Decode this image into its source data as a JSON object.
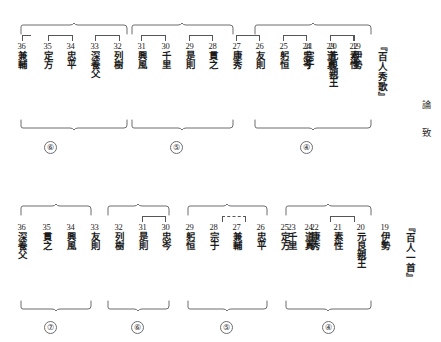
{
  "document": {
    "kind": "textual-collation-diagram",
    "side_text": [
      "論",
      "致"
    ]
  },
  "sections": [
    {
      "id": "hyakunin-shuka",
      "title": "『百人秀歌』",
      "title_x": 371,
      "entries": [
        {
          "num": "36",
          "name": "兼輔",
          "x": 13
        },
        {
          "num": "35",
          "name": "定方",
          "x": 39
        },
        {
          "num": "34",
          "name": "忠平",
          "x": 63
        },
        {
          "num": "33",
          "name": "深養父",
          "x": 87
        },
        {
          "num": "32",
          "name": "列樹",
          "x": 110
        },
        {
          "num": "31",
          "name": "興風",
          "x": 133
        },
        {
          "num": "30",
          "name": "千里",
          "x": 157
        },
        {
          "num": "29",
          "name": "是則",
          "x": 181
        },
        {
          "num": "28",
          "name": "貫之",
          "x": 204
        },
        {
          "num": "27",
          "name": "康秀",
          "x": 228
        },
        {
          "num": "26",
          "name": "友則",
          "x": 251
        },
        {
          "num": "25",
          "name": "躬恒",
          "x": 275
        },
        {
          "num": "24",
          "name": "忠岑",
          "x": 298
        },
        {
          "num": "23",
          "name": "道真",
          "x": 322
        },
        {
          "num": "22",
          "name": "素性",
          "x": 345
        },
        {
          "num": "21",
          "name": "宗于",
          "x": 300
        },
        {
          "num": "20",
          "name": "元良親王",
          "x": 325
        },
        {
          "num": "19",
          "name": "伊勢",
          "x": 350
        }
      ],
      "groups": [
        {
          "label": "⑥",
          "circle": "6"
        },
        {
          "label": "⑤",
          "circle": "5"
        },
        {
          "label": "④",
          "circle": "4"
        }
      ]
    },
    {
      "id": "hyakunin-isshu",
      "title": "『百人一首』",
      "entries": [
        {
          "num": "36",
          "name": "深養父"
        },
        {
          "num": "35",
          "name": "貫之"
        },
        {
          "num": "34",
          "name": "興風"
        },
        {
          "num": "33",
          "name": "友則"
        },
        {
          "num": "32",
          "name": "列樹"
        },
        {
          "num": "31",
          "name": "是則"
        },
        {
          "num": "30",
          "name": "忠岑"
        },
        {
          "num": "29",
          "name": "躬恒"
        },
        {
          "num": "28",
          "name": "宗于"
        },
        {
          "num": "27",
          "name": "兼輔"
        },
        {
          "num": "26",
          "name": "忠平"
        },
        {
          "num": "25",
          "name": "定方"
        },
        {
          "num": "24",
          "name": "道真"
        },
        {
          "num": "23",
          "name": "千里"
        },
        {
          "num": "22",
          "name": "康秀"
        },
        {
          "num": "21",
          "name": "素性"
        },
        {
          "num": "20",
          "name": "元良親王"
        },
        {
          "num": "19",
          "name": "伊勢"
        }
      ],
      "groups": [
        {
          "label": "⑦"
        },
        {
          "label": "⑥"
        },
        {
          "label": "⑤"
        },
        {
          "label": "④"
        }
      ]
    }
  ],
  "top": {
    "title": "『百人秀歌』",
    "e0_num": "36",
    "e0_name": "兼輔",
    "e1_num": "35",
    "e1_name": "定方",
    "e2_num": "34",
    "e2_name": "忠平",
    "e3_num": "33",
    "e3_name": "深養父",
    "e4_num": "32",
    "e4_name": "列樹",
    "e5_num": "31",
    "e5_name": "興風",
    "e6_num": "30",
    "e6_name": "千里",
    "e7_num": "29",
    "e7_name": "是則",
    "e8_num": "28",
    "e8_name": "貫之",
    "e9_num": "27",
    "e9_name": "康秀",
    "e10_num": "26",
    "e10_name": "友則",
    "e11_num": "25",
    "e11_name": "躬恒",
    "e12_num": "24",
    "e12_name": "忠岑",
    "e13_num": "23",
    "e13_name": "道真",
    "e14_num": "22",
    "e14_name": "素性",
    "e15_num": "21",
    "e15_name": "宗于",
    "e16_num": "20",
    "e16_name": "元良親王",
    "e17_num": "19",
    "e17_name": "伊勢",
    "g0": "⑥",
    "g1": "⑤",
    "g2": "④"
  },
  "bottom": {
    "title": "『百人一首』",
    "e0_num": "36",
    "e0_name": "深養父",
    "e1_num": "35",
    "e1_name": "貫之",
    "e2_num": "34",
    "e2_name": "興風",
    "e3_num": "33",
    "e3_name": "友則",
    "e4_num": "32",
    "e4_name": "列樹",
    "e5_num": "31",
    "e5_name": "是則",
    "e6_num": "30",
    "e6_name": "忠岑",
    "e7_num": "29",
    "e7_name": "躬恒",
    "e8_num": "28",
    "e8_name": "宗于",
    "e9_num": "27",
    "e9_name": "兼輔",
    "e10_num": "26",
    "e10_name": "忠平",
    "e11_num": "25",
    "e11_name": "定方",
    "e12_num": "24",
    "e12_name": "道真",
    "e13_num": "23",
    "e13_name": "千里",
    "e14_num": "22",
    "e14_name": "康秀",
    "e15_num": "21",
    "e15_name": "素性",
    "e16_num": "20",
    "e16_name": "元良親王",
    "e17_num": "19",
    "e17_name": "伊勢",
    "g0": "⑦",
    "g1": "⑥",
    "g2": "⑤",
    "g3": "④"
  },
  "side": {
    "char1": "論",
    "char2": "致"
  },
  "colors": {
    "text": "#1b1b1b",
    "rule": "#6c6d72",
    "background": "#ffffff"
  }
}
